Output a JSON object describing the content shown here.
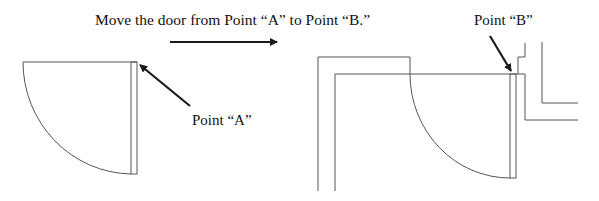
{
  "instruction": "Move the door from Point “A” to Point “B.”",
  "labels": {
    "point_a": "Point “A”",
    "point_b": "Point “B”"
  },
  "colors": {
    "line": "#555555",
    "arrow": "#1a1a1a",
    "text": "#111111"
  }
}
